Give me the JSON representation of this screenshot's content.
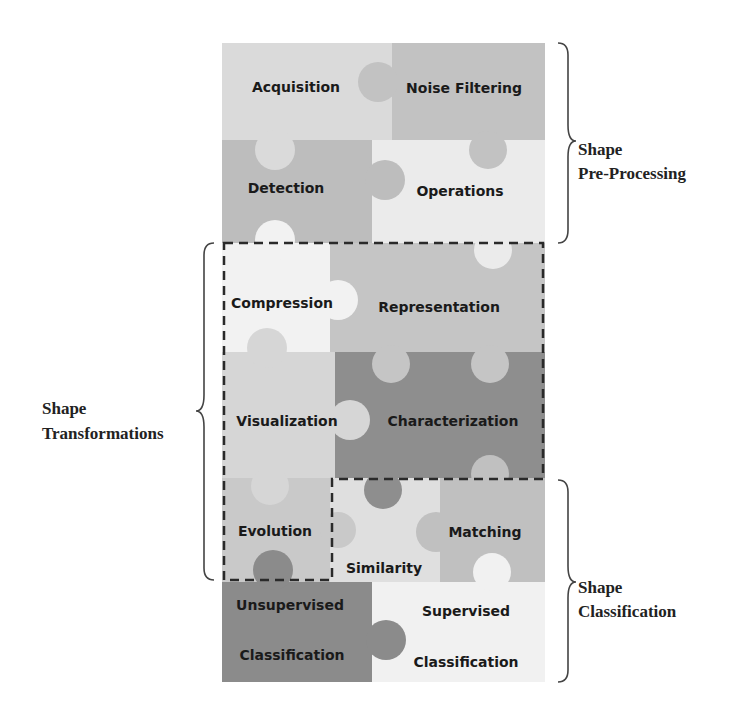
{
  "diagram": {
    "pieces": [
      {
        "id": "acquisition",
        "label": "Acquisition",
        "fill": "#dadada"
      },
      {
        "id": "noise-filtering",
        "label": "Noise Filtering",
        "fill": "#c2c2c2"
      },
      {
        "id": "detection",
        "label": "Detection",
        "fill": "#bdbdbd"
      },
      {
        "id": "operations",
        "label": "Operations",
        "fill": "#ebebeb"
      },
      {
        "id": "compression",
        "label": "Compression",
        "fill": "#f2f2f2"
      },
      {
        "id": "representation",
        "label": "Representation",
        "fill": "#c5c5c5"
      },
      {
        "id": "visualization",
        "label": "Visualization",
        "fill": "#d6d6d6"
      },
      {
        "id": "characterization",
        "label": "Characterization",
        "fill": "#8e8e8e"
      },
      {
        "id": "evolution",
        "label": "Evolution",
        "fill": "#c9c9c9"
      },
      {
        "id": "similarity",
        "label": "Similarity",
        "fill": "#dfdfdf"
      },
      {
        "id": "matching",
        "label": "Matching",
        "fill": "#c0c0c0"
      },
      {
        "id": "unsupervised-classification",
        "label_line1": "Unsupervised",
        "label_line2": "Classification",
        "fill": "#8b8b8b"
      },
      {
        "id": "supervised-classification",
        "label_line1": "Supervised",
        "label_line2": "Classification",
        "fill": "#f1f1f1"
      }
    ],
    "groups": {
      "pre_processing": {
        "line1": "Shape",
        "line2": "Pre-Processing"
      },
      "transformations": {
        "line1": "Shape",
        "line2": "Transformations"
      },
      "classification": {
        "line1": "Shape",
        "line2": "Classification"
      }
    },
    "colors": {
      "dash_border": "#2a2a2a",
      "brace": "#444444",
      "text": "#1a1a1a"
    }
  }
}
